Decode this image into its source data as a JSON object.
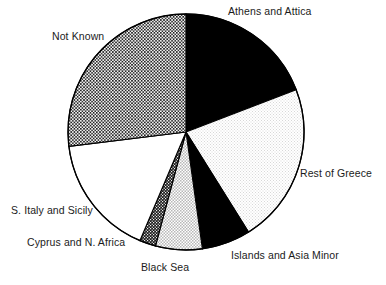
{
  "chart_data": {
    "type": "pie",
    "title": "",
    "subtitle": "",
    "xlabel": "",
    "ylabel": "",
    "legend_position": "none",
    "grid": false,
    "labels_placement": "outside-callout",
    "center": {
      "x": 186,
      "y": 132
    },
    "radius": 118,
    "start_angle_deg": 0,
    "direction": "clockwise",
    "categories": [
      "Athens and Attica",
      "Rest of Greece",
      "Islands and Asia Minor",
      "Black Sea",
      "Cyprus and N. Africa",
      "S. Italy and Sicily",
      "Not Known"
    ],
    "values": [
      19.2,
      22.0,
      6.7,
      6.4,
      2.2,
      16.7,
      26.8
    ],
    "units": "percent",
    "slices": [
      {
        "label": "Athens and Attica",
        "value": 19.2,
        "start_deg": 0,
        "end_deg": 69,
        "fill": "solid-black",
        "fill_color": "#000000"
      },
      {
        "label": "Rest of Greece",
        "value": 22.0,
        "start_deg": 69,
        "end_deg": 148,
        "fill": "fine-light-checker",
        "fill_color": "#f2f2f2"
      },
      {
        "label": "Islands and Asia Minor",
        "value": 6.7,
        "start_deg": 148,
        "end_deg": 172,
        "fill": "solid-black",
        "fill_color": "#1a1410"
      },
      {
        "label": "Black Sea",
        "value": 6.4,
        "start_deg": 172,
        "end_deg": 195,
        "fill": "medium-light-checker",
        "fill_color": "#dcdcdc"
      },
      {
        "label": "Cyprus and N. Africa",
        "value": 2.2,
        "start_deg": 195,
        "end_deg": 203,
        "fill": "dense-dark-checker",
        "fill_color": "#555555"
      },
      {
        "label": "S. Italy and Sicily",
        "value": 16.7,
        "start_deg": 203,
        "end_deg": 263,
        "fill": "solid-white",
        "fill_color": "#ffffff"
      },
      {
        "label": "Not Known",
        "value": 26.8,
        "start_deg": 263,
        "end_deg": 360,
        "fill": "dark-checker",
        "fill_color": "#8c8c8c"
      }
    ],
    "outline_color": "#000000",
    "background_color": "#ffffff"
  },
  "labels": {
    "athens": "Athens and Attica",
    "not_known": "Not Known",
    "rest_of_greece": "Rest of Greece",
    "s_italy": "S. Italy and Sicily",
    "cyprus": "Cyprus and N. Africa",
    "black_sea": "Black Sea",
    "islands": "Islands and Asia Minor"
  }
}
